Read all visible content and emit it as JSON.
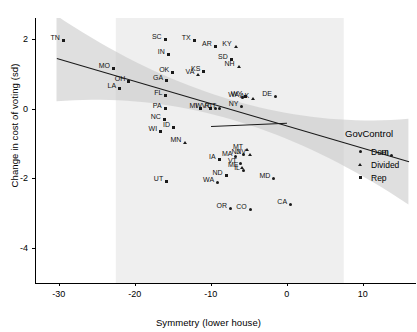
{
  "chart_data": {
    "type": "scatter",
    "title": "",
    "xlabel": "Symmetry (lower house)",
    "ylabel": "Change in cost of voting (sd)",
    "xlim": [
      -33,
      17
    ],
    "ylim": [
      -5.0,
      2.6
    ],
    "xticks": [
      -30,
      -20,
      -10,
      0,
      10
    ],
    "xticklabels": [
      "-30",
      "-20",
      "-10",
      "0",
      "10"
    ],
    "yticks": [
      2,
      0,
      -2,
      -4
    ],
    "yticklabels": [
      "2",
      "0",
      "-2",
      "-4"
    ],
    "grid": false,
    "point_label_field": "state abbreviation",
    "legend": {
      "position": "right",
      "title": "GovControl",
      "entries": [
        {
          "label": "Dem",
          "marker": "circle"
        },
        {
          "label": "Divided",
          "marker": "triangle"
        },
        {
          "label": "Rep",
          "marker": "square"
        }
      ]
    },
    "points": [
      {
        "label": "TN",
        "x": -29.6,
        "y": 2.0,
        "marker": "square"
      },
      {
        "label": "MO",
        "x": -23.0,
        "y": 1.21,
        "marker": "square"
      },
      {
        "label": "OH",
        "x": -21.0,
        "y": 0.82,
        "marker": "square"
      },
      {
        "label": "LA",
        "x": -22.2,
        "y": 0.63,
        "marker": "square"
      },
      {
        "label": "SC",
        "x": -16.2,
        "y": 2.02,
        "marker": "square"
      },
      {
        "label": "IN",
        "x": -15.8,
        "y": 1.6,
        "marker": "square"
      },
      {
        "label": "OK",
        "x": -15.2,
        "y": 1.09,
        "marker": "square"
      },
      {
        "label": "GA",
        "x": -16.0,
        "y": 0.85,
        "marker": "square"
      },
      {
        "label": "FL",
        "x": -16.1,
        "y": 0.42,
        "marker": "square"
      },
      {
        "label": "PA",
        "x": -16.2,
        "y": 0.06,
        "marker": "square"
      },
      {
        "label": "NC",
        "x": -16.3,
        "y": -0.26,
        "marker": "square"
      },
      {
        "label": "ID",
        "x": -15.1,
        "y": -0.49,
        "marker": "square"
      },
      {
        "label": "WI",
        "x": -16.8,
        "y": -0.62,
        "marker": "square"
      },
      {
        "label": "MN",
        "x": -13.6,
        "y": -0.92,
        "marker": "triangle"
      },
      {
        "label": "UT",
        "x": -16.0,
        "y": -2.05,
        "marker": "square"
      },
      {
        "label": "TX",
        "x": -12.4,
        "y": 1.99,
        "marker": "square"
      },
      {
        "label": "VA",
        "x": -11.9,
        "y": 1.02,
        "marker": "triangle"
      },
      {
        "label": "KS",
        "x": -11.1,
        "y": 1.1,
        "marker": "square"
      },
      {
        "label": "MI",
        "x": -11.5,
        "y": 0.05,
        "marker": "square"
      },
      {
        "label": "WV",
        "x": -10.3,
        "y": 0.06,
        "marker": "square"
      },
      {
        "label": "RI",
        "x": -9.6,
        "y": 0.06,
        "marker": "circle"
      },
      {
        "label": "CT",
        "x": -9.0,
        "y": 0.05,
        "marker": "circle"
      },
      {
        "label": "AR",
        "x": -9.6,
        "y": 1.82,
        "marker": "square"
      },
      {
        "label": "KY",
        "x": -7.0,
        "y": 1.82,
        "marker": "triangle"
      },
      {
        "label": "SD",
        "x": -7.5,
        "y": 1.45,
        "marker": "square"
      },
      {
        "label": "NH",
        "x": -6.6,
        "y": 1.26,
        "marker": "triangle"
      },
      {
        "label": "WA",
        "x": -6.0,
        "y": 0.37,
        "marker": "circle"
      },
      {
        "label": "WY",
        "x": -5.6,
        "y": 0.38,
        "marker": "square"
      },
      {
        "label": "NY",
        "x": -6.1,
        "y": 0.12,
        "marker": "circle"
      },
      {
        "label": "AK",
        "x": -4.7,
        "y": 0.33,
        "marker": "triangle"
      },
      {
        "label": "DE",
        "x": -1.7,
        "y": 0.4,
        "marker": "circle"
      },
      {
        "label": "MT",
        "x": -5.5,
        "y": -1.13,
        "marker": "triangle"
      },
      {
        "label": "MA",
        "x": -6.9,
        "y": -1.33,
        "marker": "circle"
      },
      {
        "label": "NJ",
        "x": -5.9,
        "y": -1.28,
        "marker": "circle"
      },
      {
        "label": "NV",
        "x": -5.1,
        "y": -1.28,
        "marker": "triangle"
      },
      {
        "label": "IA",
        "x": -9.1,
        "y": -1.4,
        "marker": "square"
      },
      {
        "label": "VT",
        "x": -6.3,
        "y": -1.52,
        "marker": "circle"
      },
      {
        "label": "ME",
        "x": -6.1,
        "y": -1.64,
        "marker": "triangle"
      },
      {
        "label": "IL",
        "x": -5.9,
        "y": -1.72,
        "marker": "circle"
      },
      {
        "label": "ND",
        "x": -8.2,
        "y": -1.86,
        "marker": "square"
      },
      {
        "label": "WA",
        "x": -9.3,
        "y": -2.07,
        "marker": "circle"
      },
      {
        "label": "MD",
        "x": -1.9,
        "y": -1.95,
        "marker": "circle"
      },
      {
        "label": "HI",
        "x": 13.6,
        "y": -1.31,
        "marker": "circle"
      },
      {
        "label": "OR",
        "x": -7.6,
        "y": -2.82,
        "marker": "circle"
      },
      {
        "label": "CO",
        "x": -5.0,
        "y": -2.86,
        "marker": "circle"
      },
      {
        "label": "CA",
        "x": 0.3,
        "y": -2.7,
        "marker": "circle"
      }
    ],
    "trend_lines": [
      {
        "name": "main",
        "x_start": -30.3,
        "y_start": 1.44,
        "x_end": 16.0,
        "y_end": -1.52
      },
      {
        "name": "secondary",
        "x_start": -10.0,
        "y_start": -0.49,
        "x_end": 0.0,
        "y_end": -0.4
      }
    ],
    "confidence_band": {
      "description": "shaded grey confidence ribbon widening toward both ends",
      "color": "#d4d4d4"
    }
  },
  "colors": {
    "marker": "#1a1a1a",
    "line": "#1a1a1a",
    "band": "#d4d4d4",
    "axis": "#000000",
    "background": "#ffffff"
  }
}
